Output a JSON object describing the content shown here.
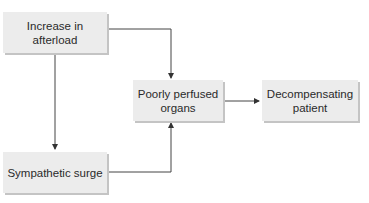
{
  "diagram": {
    "type": "flowchart",
    "nodes": [
      {
        "id": "afterload",
        "label": "Increase in afterload"
      },
      {
        "id": "sympathetic",
        "label": "Sympathetic surge"
      },
      {
        "id": "perfused",
        "label_line1": "Poorly perfused",
        "label_line2": "organs"
      },
      {
        "id": "decomp",
        "label_line1": "Decompensating",
        "label_line2": "patient"
      }
    ],
    "edges": [
      {
        "from": "afterload",
        "to": "sympathetic"
      },
      {
        "from": "afterload",
        "to": "perfused"
      },
      {
        "from": "sympathetic",
        "to": "perfused"
      },
      {
        "from": "perfused",
        "to": "decomp"
      }
    ],
    "colors": {
      "box_fill": "#ececec",
      "box_shadow": "#c4c4c4",
      "line": "#444444",
      "text": "#2a2a2a"
    }
  }
}
